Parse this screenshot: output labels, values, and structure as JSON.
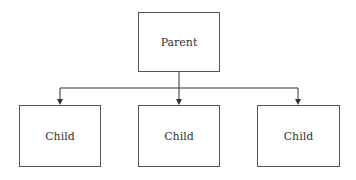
{
  "diagram": {
    "type": "hierarchy",
    "parent": {
      "label": "Parent"
    },
    "children": [
      {
        "label": "Child"
      },
      {
        "label": "Child"
      },
      {
        "label": "Child"
      }
    ],
    "line_color": "#333333"
  }
}
